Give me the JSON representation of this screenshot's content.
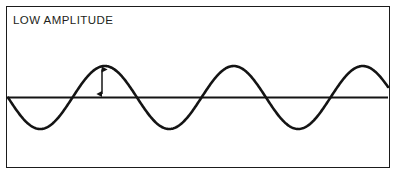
{
  "figure": {
    "caption": "LOW AMPLITUDE",
    "border_color": "#1b1b1b",
    "background_color": "#ffffff",
    "stroke_color": "#141414"
  },
  "chart_data": {
    "type": "line",
    "title": "LOW AMPLITUDE",
    "xlabel": "",
    "ylabel": "",
    "grid": false,
    "legend": "none",
    "annotations": [
      {
        "name": "amplitude-arrow",
        "kind": "double-headed-vertical-arrow",
        "x": 102,
        "y_top": 66,
        "y_bottom": 97,
        "measures": "amplitude"
      }
    ],
    "baseline": {
      "y": 97.5,
      "x_start": 8,
      "x_end": 388,
      "label": "equilibrium-axis"
    },
    "waveform": {
      "shape": "sine",
      "amplitude_px": 31.5,
      "period_px": 129,
      "phase": "starts at zero descending",
      "baseline_y": 97.5,
      "x_start": 8,
      "x_end": 388,
      "crest_x": [
        102,
        231,
        360
      ],
      "crest_y": 66,
      "trough_x": [
        38,
        167,
        296
      ],
      "trough_y": 129,
      "zero_crossings_x": [
        8,
        70,
        135,
        199,
        264,
        328,
        388
      ]
    },
    "x": [
      8,
      38,
      70,
      102,
      135,
      167,
      199,
      231,
      264,
      296,
      328,
      360,
      388
    ],
    "values": [
      0,
      -31.5,
      0,
      31.5,
      0,
      -31.5,
      0,
      31.5,
      0,
      -31.5,
      0,
      31.5,
      0
    ],
    "ylim": [
      -31.5,
      31.5
    ]
  }
}
